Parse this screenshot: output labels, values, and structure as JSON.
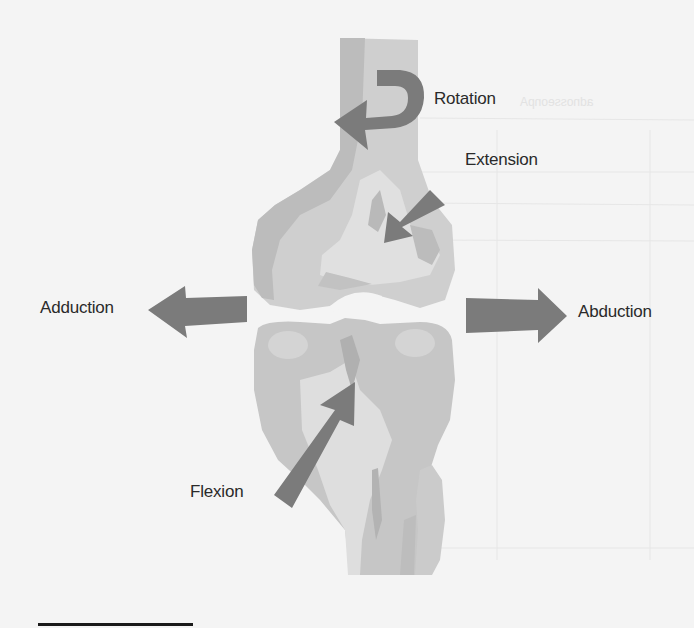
{
  "figure": {
    "colors": {
      "background": "#f4f4f4",
      "bone_light": "#d6d6d6",
      "bone_mid": "#bdbdbd",
      "bone_dark": "#a9a9a9",
      "arrow": "#7b7b7b",
      "label_text": "#2a2a2a",
      "rule": "#1a1a1a"
    },
    "labels": {
      "rotation": "Rotation",
      "extension": "Extension",
      "adduction": "Adduction",
      "abduction": "Abduction",
      "flexion": "Flexion"
    },
    "arrows": [
      {
        "name": "rotation",
        "direction": "counter-clockwise",
        "icon": "curved-arrow"
      },
      {
        "name": "extension",
        "direction": "down-left",
        "icon": "arrow"
      },
      {
        "name": "adduction",
        "direction": "left",
        "icon": "arrow"
      },
      {
        "name": "abduction",
        "direction": "right",
        "icon": "arrow"
      },
      {
        "name": "flexion",
        "direction": "up-right",
        "icon": "arrow"
      }
    ]
  }
}
